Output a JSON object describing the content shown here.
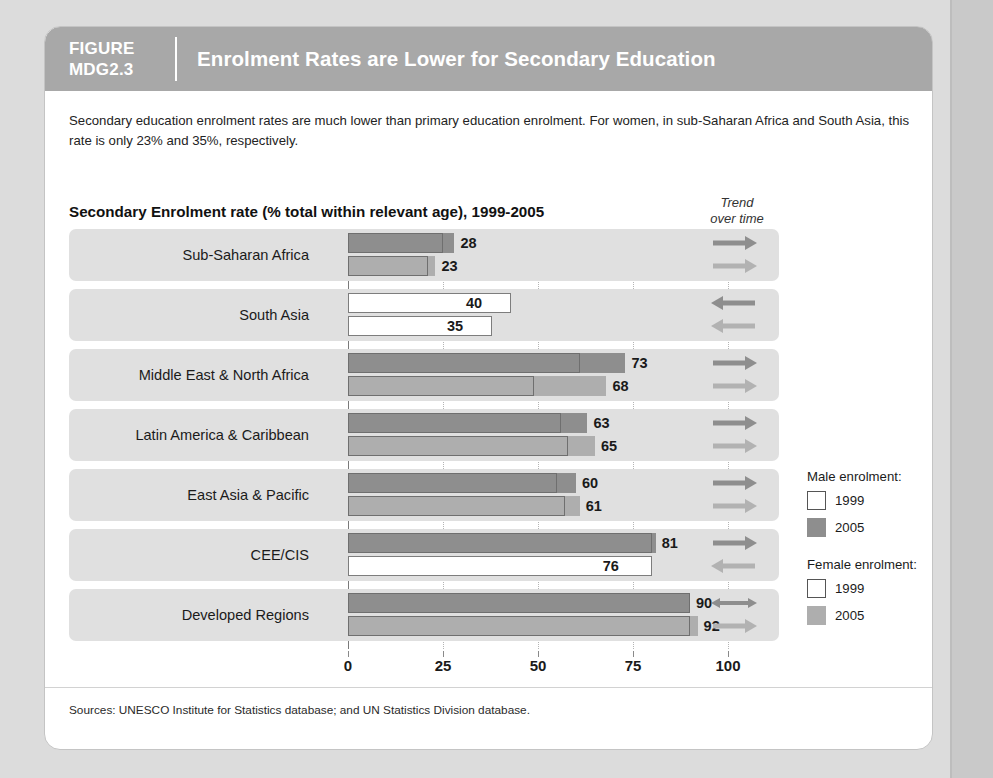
{
  "figure": {
    "tag_line1": "FIGURE",
    "tag_line2": "MDG2.3",
    "title": "Enrolment Rates are Lower for Secondary Education",
    "description": "Secondary education enrolment rates are much lower than primary education enrolment. For women, in sub-Saharan Africa and South Asia, this rate is only 23% and 35%, respectively.",
    "sources": "Sources: UNESCO Institute for Statistics database; and UN Statistics Division database.",
    "header_bg": "#a8a8a8"
  },
  "trend_header": {
    "line1": "Trend",
    "line2": "over time"
  },
  "legend": {
    "male_title": "Male enrolment:",
    "female_title": "Female enrolment:",
    "male_1999": "1999",
    "male_2005": "2005",
    "female_1999": "1999",
    "female_2005": "2005",
    "colors": {
      "male_2005": "#8e8e8e",
      "female_2005": "#aeaeae",
      "y1999_fill": "#ffffff",
      "y1999_border": "#555555"
    }
  },
  "chart_data": {
    "type": "bar",
    "title": "Secondary Enrolment rate (% total within relevant age), 1999-2005",
    "xlabel": "",
    "ylabel": "",
    "xlim": [
      0,
      100
    ],
    "ticks": [
      0,
      25,
      50,
      75,
      100
    ],
    "tick_labels": [
      "0",
      "25",
      "50",
      "75",
      "100"
    ],
    "grid": true,
    "orientation": "horizontal",
    "legend_position": "right",
    "categories": [
      "Sub-Saharan Africa",
      "South Asia",
      "Middle East & North Africa",
      "Latin America & Caribbean",
      "East Asia & Pacific",
      "CEE/CIS",
      "Developed Regions"
    ],
    "series": [
      {
        "name": "Male enrolment 1999",
        "values": [
          25,
          43,
          61,
          56,
          55,
          80,
          90
        ]
      },
      {
        "name": "Male enrolment 2005",
        "values": [
          28,
          40,
          73,
          63,
          60,
          81,
          90
        ]
      },
      {
        "name": "Female enrolment 1999",
        "values": [
          21,
          38,
          49,
          58,
          57,
          80,
          90
        ]
      },
      {
        "name": "Female enrolment 2005",
        "values": [
          23,
          35,
          68,
          65,
          61,
          76,
          92
        ]
      }
    ],
    "data_labels": {
      "male": [
        "28",
        "40",
        "73",
        "63",
        "60",
        "81",
        "90"
      ],
      "female": [
        "23",
        "35",
        "68",
        "65",
        "61",
        "76",
        "92"
      ]
    },
    "trends": {
      "male": [
        "right",
        "left",
        "right",
        "right",
        "right",
        "right",
        "both"
      ],
      "female": [
        "right",
        "left",
        "right",
        "right",
        "right",
        "left",
        "right"
      ]
    }
  }
}
